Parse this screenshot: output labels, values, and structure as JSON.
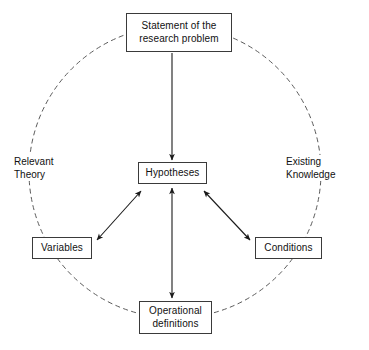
{
  "diagram": {
    "colors": {
      "background": "#ffffff",
      "box_border": "#3a3a3a",
      "box_fill": "#ffffff",
      "text": "#111111",
      "arrow": "#1a1a1a",
      "dashed_circle": "#5a5a5a"
    },
    "nodes": [
      {
        "id": "statement",
        "line1": "Statement of the",
        "line2": "research problem"
      },
      {
        "id": "hypotheses",
        "line1": "Hypotheses",
        "line2": ""
      },
      {
        "id": "variables",
        "line1": "Variables",
        "line2": ""
      },
      {
        "id": "conditions",
        "line1": "Conditions",
        "line2": ""
      },
      {
        "id": "operational",
        "line1": "Operational",
        "line2": "definitions"
      }
    ],
    "ring_labels": [
      {
        "id": "relevant-theory",
        "line1": "Relevant",
        "line2": "Theory"
      },
      {
        "id": "existing-knowledge",
        "line1": "Existing",
        "line2": "Knowledge"
      }
    ],
    "connectors": [
      {
        "id": "statement-to-hypotheses",
        "from": "statement",
        "to": "hypotheses",
        "heads": "single",
        "direction": "down"
      },
      {
        "id": "variables-hypotheses",
        "from": "variables",
        "to": "hypotheses",
        "heads": "double",
        "direction": "diagonal-up-right"
      },
      {
        "id": "hypotheses-conditions",
        "from": "hypotheses",
        "to": "conditions",
        "heads": "double",
        "direction": "diagonal-down-right"
      },
      {
        "id": "hypotheses-operational",
        "from": "hypotheses",
        "to": "operational",
        "heads": "double",
        "direction": "vertical"
      }
    ],
    "circle": {
      "id": "dashed-circle",
      "center_x": 175,
      "center_y": 172,
      "radius": 146,
      "style": "dashed"
    }
  }
}
